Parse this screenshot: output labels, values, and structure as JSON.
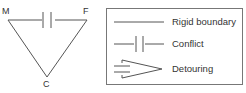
{
  "diagram": {
    "nodes": [
      {
        "id": "M",
        "label": "M"
      },
      {
        "id": "F",
        "label": "F"
      },
      {
        "id": "C",
        "label": "C"
      }
    ],
    "edges": [
      {
        "from": "M",
        "to": "F",
        "type": "Conflict"
      },
      {
        "from": "M",
        "to": "C",
        "type": "Rigid boundary"
      },
      {
        "from": "F",
        "to": "C",
        "type": "Rigid boundary"
      }
    ]
  },
  "legend": {
    "items": [
      {
        "symbol": "rigid-boundary",
        "label": "Rigid boundary"
      },
      {
        "symbol": "conflict",
        "label": "Conflict"
      },
      {
        "symbol": "detouring",
        "label": "Detouring"
      }
    ]
  },
  "colors": {
    "line": "#555555",
    "text": "#333333",
    "border": "#777777"
  }
}
